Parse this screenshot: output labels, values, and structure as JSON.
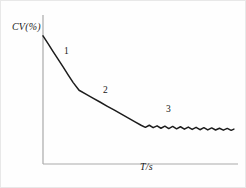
{
  "figure": {
    "background_color": "#fefefe",
    "border_color": "#e8e8e8",
    "width": 246,
    "height": 188
  },
  "axes": {
    "color": "#a9a9a9",
    "x_label": "T/s",
    "y_label": "CV(%)",
    "origin_px": [
      42,
      163
    ],
    "y_axis_top_px": [
      42,
      14
    ],
    "x_axis_right_px": [
      237,
      163
    ]
  },
  "curve": {
    "color": "#1c1c1c",
    "width_px": 1.5
  },
  "annotations": [
    {
      "id": "1",
      "label": "1",
      "x_px": 63,
      "y_px": 45
    },
    {
      "id": "2",
      "label": "2",
      "x_px": 102,
      "y_px": 84
    },
    {
      "id": "3",
      "label": "3",
      "x_px": 165,
      "y_px": 103
    }
  ],
  "chart_data": {
    "type": "line",
    "title": "",
    "subtitle": "",
    "xlabel": "T/s",
    "ylabel": "CV(%)",
    "grid": false,
    "legend": "none",
    "axis_ticks": {
      "x": [],
      "y": []
    },
    "xlim": [
      0,
      100
    ],
    "ylim": [
      0,
      100
    ],
    "annotations": [
      "1",
      "2",
      "3"
    ],
    "series": [
      {
        "name": "CV(%) vs T/s",
        "regimes": [
          {
            "label": "1",
            "kind": "steep-linear-decline",
            "x": [
              0,
              18.5
            ],
            "y": [
              86,
              49.5
            ]
          },
          {
            "label": "2",
            "kind": "gentle-linear-decline",
            "x": [
              18.5,
              50.3
            ],
            "y": [
              49.5,
              26
            ]
          },
          {
            "label": "3",
            "kind": "noisy-plateau",
            "x": [
              50.3,
              97.9
            ],
            "y": [
              26,
              23
            ],
            "noise_amplitude": 1.6,
            "oscillation_count": 20
          }
        ],
        "x": [
          0,
          2.6,
          5.1,
          7.7,
          10.3,
          12.8,
          15.4,
          18.5,
          22.0,
          25.6,
          29.2,
          32.8,
          36.4,
          40.0,
          43.6,
          47.2,
          50.3,
          52.5,
          54.5,
          56.5,
          58.5,
          60.5,
          62.5,
          64.5,
          66.5,
          68.5,
          70.5,
          72.5,
          74.5,
          76.5,
          78.5,
          80.5,
          82.5,
          84.5,
          86.5,
          88.5,
          90.5,
          92.5,
          94.5,
          96.5,
          97.9
        ],
        "y": [
          86,
          80.8,
          75.6,
          70.4,
          65.2,
          60.0,
          54.8,
          49.5,
          46.9,
          44.2,
          41.6,
          38.9,
          36.3,
          33.6,
          31.0,
          28.3,
          26.0,
          24.6,
          26.0,
          24.4,
          25.6,
          24.0,
          25.4,
          23.8,
          25.2,
          23.6,
          25.0,
          23.4,
          24.8,
          23.2,
          24.6,
          23.0,
          24.4,
          22.9,
          24.2,
          22.8,
          24.0,
          22.7,
          23.9,
          22.6,
          23.4
        ]
      }
    ]
  }
}
